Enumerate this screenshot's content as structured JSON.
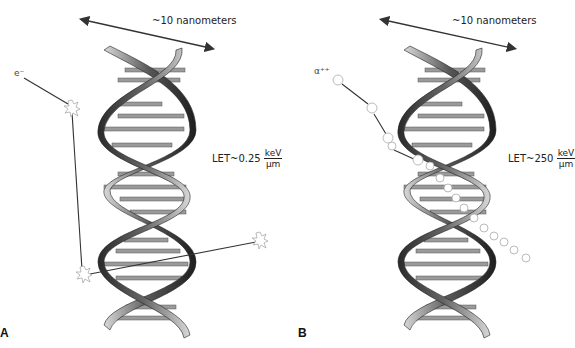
{
  "figure": {
    "panels": [
      {
        "id": "A",
        "letter": "A",
        "scale_label": "~10 nanometers",
        "particle_label": "e⁻",
        "particle_name": "electron",
        "let_prefix": "LET~0.25",
        "let_unit_num": "keV",
        "let_unit_den": "µm",
        "track_type": "sparse",
        "base_pairs": [
          "A–T",
          "A–T",
          "G–C",
          "A–T",
          "T–A",
          "G–C",
          "T–A",
          "C–G",
          "C–G",
          "A–T",
          "G–C",
          "T–A",
          "C–G",
          "A–T",
          "G–C",
          "T–A"
        ]
      },
      {
        "id": "B",
        "letter": "B",
        "scale_label": "~10 nanometers",
        "particle_label": "α⁺⁺",
        "particle_name": "alpha particle",
        "let_prefix": "LET~250",
        "let_unit_num": "keV",
        "let_unit_den": "µm",
        "track_type": "dense",
        "base_pairs": [
          "A–T",
          "A–T",
          "G–C",
          "A–T",
          "T–A",
          "G–C",
          "T–A",
          "C–G",
          "C–G",
          "A–T",
          "G–C",
          "T–A",
          "C–G",
          "A–T",
          "G–C",
          "T–A"
        ]
      }
    ],
    "strand_labels": {
      "phosphate": "P",
      "sugar": "S"
    },
    "colors": {
      "ribbon_dark": "#2a2a2a",
      "ribbon_light": "#d0d0d0",
      "rung": "#8a8a8a",
      "track": "#333333",
      "ionization": "#bdbdbd"
    }
  }
}
